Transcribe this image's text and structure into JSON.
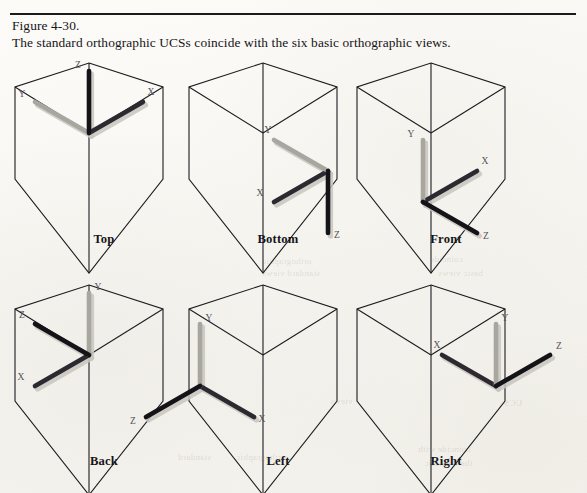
{
  "figure": {
    "number_line": "Figure 4-30.",
    "caption_line": "The standard orthographic UCSs coincide with the six basic orthographic views."
  },
  "colors": {
    "page_background": "#fbfaf7",
    "rule": "#1b1a1d",
    "hex_stroke": "#1d1c20",
    "axis_dark": "#141317",
    "axis_mid": "#4a4850",
    "axis_light": "#a9a6a0",
    "axis_shadow": "#c9c6c0",
    "label_text": "#161519",
    "axis_letter": "#55525a"
  },
  "axis_letters": {
    "x": "X",
    "y": "Y",
    "z": "Z"
  },
  "views": [
    {
      "id": "top",
      "label": "Top",
      "origin": {
        "x": 75,
        "y": 93
      },
      "axes": [
        {
          "name": "X",
          "dx": 54,
          "dy": -31,
          "shade": "dark",
          "label_dx": 8,
          "label_dy": -7
        },
        {
          "name": "Y",
          "dx": -54,
          "dy": -31,
          "shade": "light",
          "label_dx": -13,
          "label_dy": -5
        },
        {
          "name": "Z",
          "dx": 0,
          "dy": -62,
          "shade": "darkest",
          "label_dx": -11,
          "label_dy": -3
        }
      ]
    },
    {
      "id": "bottom",
      "label": "Bottom",
      "origin": {
        "x": 140,
        "y": 131
      },
      "axes": [
        {
          "name": "X",
          "dx": -54,
          "dy": 31,
          "shade": "dark",
          "label_dx": -14,
          "label_dy": -6
        },
        {
          "name": "Y",
          "dx": -54,
          "dy": -31,
          "shade": "light",
          "label_dx": -6,
          "label_dy": -7
        },
        {
          "name": "Z",
          "dx": 0,
          "dy": 62,
          "shade": "darkest",
          "label_dx": 9,
          "label_dy": 5
        }
      ]
    },
    {
      "id": "front",
      "label": "Front",
      "origin": {
        "x": 67,
        "y": 162
      },
      "axes": [
        {
          "name": "X",
          "dx": 54,
          "dy": -31,
          "shade": "dark",
          "label_dx": 8,
          "label_dy": -7
        },
        {
          "name": "Y",
          "dx": 0,
          "dy": -62,
          "shade": "light",
          "label_dx": -12,
          "label_dy": -3
        },
        {
          "name": "Z",
          "dx": 54,
          "dy": 31,
          "shade": "darkest",
          "label_dx": 9,
          "label_dy": 6
        }
      ]
    },
    {
      "id": "back",
      "label": "Back",
      "origin": {
        "x": 75,
        "y": 93
      },
      "axes": [
        {
          "name": "X",
          "dx": -54,
          "dy": 31,
          "shade": "dark",
          "label_dx": -14,
          "label_dy": -6
        },
        {
          "name": "Y",
          "dx": 0,
          "dy": -62,
          "shade": "light",
          "label_dx": 9,
          "label_dy": -3
        },
        {
          "name": "Z",
          "dx": -54,
          "dy": -31,
          "shade": "darkest",
          "label_dx": -13,
          "label_dy": -6
        }
      ]
    },
    {
      "id": "left",
      "label": "Left",
      "origin": {
        "x": 12,
        "y": 124
      },
      "axes": [
        {
          "name": "X",
          "dx": 54,
          "dy": 31,
          "shade": "dark",
          "label_dx": 8,
          "label_dy": 5
        },
        {
          "name": "Y",
          "dx": 0,
          "dy": -62,
          "shade": "light",
          "label_dx": 9,
          "label_dy": -3
        },
        {
          "name": "Z",
          "dx": -54,
          "dy": 31,
          "shade": "darkest",
          "label_dx": -13,
          "label_dy": 7
        }
      ]
    },
    {
      "id": "right",
      "label": "Right",
      "origin": {
        "x": 140,
        "y": 124
      },
      "axes": [
        {
          "name": "X",
          "dx": -54,
          "dy": -31,
          "shade": "dark",
          "label_dx": -5,
          "label_dy": -7
        },
        {
          "name": "Y",
          "dx": 0,
          "dy": -62,
          "shade": "light",
          "label_dx": 9,
          "label_dy": -3
        },
        {
          "name": "Z",
          "dx": 54,
          "dy": -31,
          "shade": "darkest",
          "label_dx": 9,
          "label_dy": -6
        }
      ]
    }
  ],
  "ghost_marks": [
    {
      "x": 262,
      "y": 256,
      "text": "orthographic"
    },
    {
      "x": 262,
      "y": 268,
      "text": "standard views"
    },
    {
      "x": 430,
      "y": 254,
      "text": "coincide"
    },
    {
      "x": 438,
      "y": 268,
      "text": "basic views"
    },
    {
      "x": 236,
      "y": 452,
      "text": "orthographic"
    },
    {
      "x": 178,
      "y": 452,
      "text": "standard"
    },
    {
      "x": 418,
      "y": 444,
      "text": "coincide with"
    },
    {
      "x": 424,
      "y": 458,
      "text": "the six basic"
    },
    {
      "x": 330,
      "y": 396,
      "text": "views"
    },
    {
      "x": 500,
      "y": 398,
      "text": "UCSs"
    }
  ]
}
